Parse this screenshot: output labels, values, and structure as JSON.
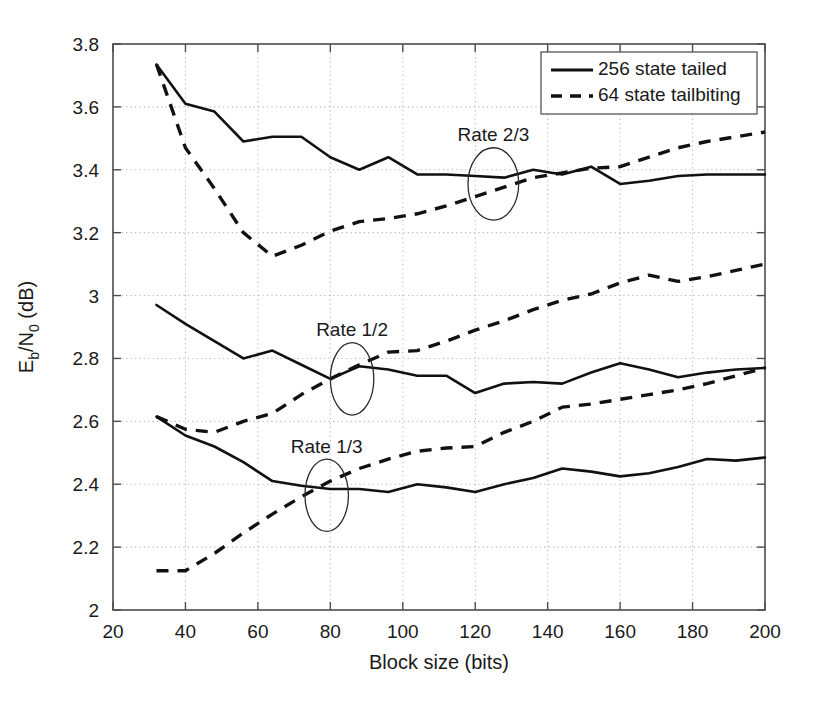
{
  "chart_data": {
    "type": "line",
    "title": "",
    "xlabel": "Block size (bits)",
    "ylabel": "E_b/N_0 (dB)",
    "ylabel_parts": {
      "base": "E",
      "sub1": "b",
      "slash": "/N",
      "sub2": "0",
      "unit": " (dB)"
    },
    "xlim": [
      20,
      200
    ],
    "ylim": [
      2,
      3.8
    ],
    "xticks": [
      20,
      40,
      60,
      80,
      100,
      120,
      140,
      160,
      180,
      200
    ],
    "xtick_labels": [
      "20",
      "40",
      "60",
      "80",
      "100",
      "120",
      "140",
      "160",
      "180",
      "200"
    ],
    "yticks": [
      2,
      2.2,
      2.4,
      2.6,
      2.8,
      3,
      3.2,
      3.4,
      3.6,
      3.8
    ],
    "ytick_labels": [
      "2",
      "2.2",
      "2.4",
      "2.6",
      "2.8",
      "3",
      "3.2",
      "3.4",
      "3.6",
      "3.8"
    ],
    "grid": true,
    "grid_style": "dotted",
    "legend": {
      "position": "upper-right",
      "entries": [
        {
          "label": "256 state tailed",
          "style": "solid"
        },
        {
          "label": "64 state tailbiting",
          "style": "dashed"
        }
      ]
    },
    "annotations": [
      {
        "text": "Rate 2/3",
        "x": 125,
        "y": 3.49,
        "marker": "ellipse",
        "ellipse_x": 125,
        "ellipse_y": 3.355,
        "ellipse_rx": 7,
        "ellipse_ry": 0.115
      },
      {
        "text": "Rate 1/2",
        "x": 86,
        "y": 2.87,
        "marker": "ellipse",
        "ellipse_x": 86,
        "ellipse_y": 2.735,
        "ellipse_rx": 6,
        "ellipse_ry": 0.115
      },
      {
        "text": "Rate 1/3",
        "x": 79,
        "y": 2.5,
        "marker": "ellipse",
        "ellipse_x": 79,
        "ellipse_y": 2.365,
        "ellipse_rx": 6,
        "ellipse_ry": 0.115
      }
    ],
    "series": [
      {
        "name": "Rate 2/3 - 256 state tailed",
        "rate": "2/3",
        "style": "solid",
        "x": [
          32,
          40,
          48,
          56,
          64,
          72,
          80,
          88,
          96,
          104,
          112,
          120,
          128,
          136,
          144,
          152,
          160,
          168,
          176,
          184,
          192,
          200
        ],
        "y": [
          3.735,
          3.61,
          3.585,
          3.49,
          3.505,
          3.505,
          3.44,
          3.4,
          3.44,
          3.385,
          3.385,
          3.38,
          3.375,
          3.4,
          3.385,
          3.41,
          3.355,
          3.365,
          3.38,
          3.385,
          3.385,
          3.385
        ]
      },
      {
        "name": "Rate 2/3 - 64 state tailbiting",
        "rate": "2/3",
        "style": "dashed",
        "x": [
          32,
          40,
          48,
          56,
          64,
          72,
          80,
          88,
          96,
          104,
          112,
          120,
          128,
          136,
          144,
          152,
          160,
          168,
          176,
          184,
          192,
          200
        ],
        "y": [
          3.735,
          3.47,
          3.34,
          3.2,
          3.125,
          3.16,
          3.205,
          3.235,
          3.245,
          3.26,
          3.285,
          3.315,
          3.345,
          3.375,
          3.39,
          3.405,
          3.41,
          3.44,
          3.47,
          3.49,
          3.505,
          3.52
        ]
      },
      {
        "name": "Rate 1/2 - 256 state tailed",
        "rate": "1/2",
        "style": "solid",
        "x": [
          32,
          40,
          48,
          56,
          64,
          72,
          80,
          88,
          96,
          104,
          112,
          120,
          128,
          136,
          144,
          152,
          160,
          168,
          176,
          184,
          192,
          200
        ],
        "y": [
          2.97,
          2.91,
          2.855,
          2.8,
          2.825,
          2.78,
          2.735,
          2.775,
          2.765,
          2.745,
          2.745,
          2.69,
          2.72,
          2.725,
          2.72,
          2.755,
          2.785,
          2.765,
          2.74,
          2.755,
          2.765,
          2.77
        ]
      },
      {
        "name": "Rate 1/2 - 64 state tailbiting",
        "rate": "1/2",
        "style": "dashed",
        "x": [
          32,
          40,
          48,
          56,
          64,
          72,
          80,
          88,
          96,
          104,
          112,
          120,
          128,
          136,
          144,
          152,
          160,
          168,
          176,
          184,
          192,
          200
        ],
        "y": [
          2.615,
          2.575,
          2.565,
          2.6,
          2.625,
          2.685,
          2.735,
          2.78,
          2.82,
          2.825,
          2.855,
          2.89,
          2.92,
          2.955,
          2.985,
          3.005,
          3.04,
          3.065,
          3.045,
          3.06,
          3.08,
          3.1
        ]
      },
      {
        "name": "Rate 1/3 - 256 state tailed",
        "rate": "1/3",
        "style": "solid",
        "x": [
          32,
          40,
          48,
          56,
          64,
          72,
          80,
          88,
          96,
          104,
          112,
          120,
          128,
          136,
          144,
          152,
          160,
          168,
          176,
          184,
          192,
          200
        ],
        "y": [
          2.615,
          2.555,
          2.52,
          2.47,
          2.41,
          2.395,
          2.385,
          2.385,
          2.375,
          2.4,
          2.39,
          2.375,
          2.4,
          2.42,
          2.45,
          2.44,
          2.425,
          2.435,
          2.455,
          2.48,
          2.475,
          2.485
        ]
      },
      {
        "name": "Rate 1/3 - 64 state tailbiting",
        "rate": "1/3",
        "style": "dashed",
        "x": [
          32,
          40,
          48,
          56,
          64,
          72,
          80,
          88,
          96,
          104,
          112,
          120,
          128,
          136,
          144,
          152,
          160,
          168,
          176,
          184,
          192,
          200
        ],
        "y": [
          2.125,
          2.125,
          2.18,
          2.245,
          2.305,
          2.36,
          2.41,
          2.45,
          2.48,
          2.505,
          2.515,
          2.52,
          2.565,
          2.6,
          2.645,
          2.655,
          2.67,
          2.685,
          2.7,
          2.72,
          2.745,
          2.77
        ]
      }
    ]
  },
  "colors": {
    "line": "#111111",
    "axis": "#4d4d4d",
    "grid": "#b9b9b9",
    "background": "#ffffff"
  }
}
